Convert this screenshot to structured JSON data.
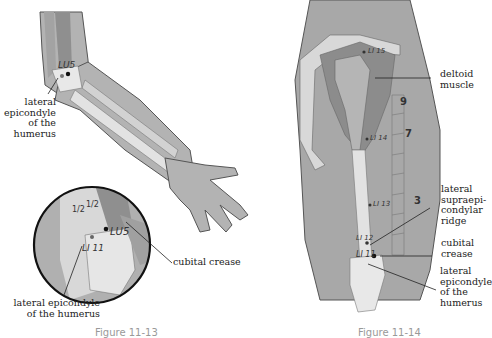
{
  "figure_left": {
    "caption": "Figure 11-13",
    "points": {
      "lu5_top": "LU5",
      "lu5_inset": "LU5",
      "li11_inset": "LI 11"
    },
    "fractions": [
      "1/2",
      "1/2"
    ],
    "labels": {
      "epicondyle_top": [
        "lateral",
        "epicondyle",
        "of the",
        "humerus"
      ],
      "cubital_crease": "cubital crease",
      "epicondyle_bottom": [
        "lateral epicondyle",
        "of the humerus"
      ]
    }
  },
  "figure_right": {
    "caption": "Figure 11-14",
    "points": {
      "li15": "LI 15",
      "li14": "LI 14",
      "li13": "LI 13",
      "li12": "LI 12",
      "li11": "LI 11"
    },
    "scale_numbers": [
      "9",
      "7",
      "3"
    ],
    "labels": {
      "deltoid": [
        "deltoid",
        "muscle"
      ],
      "supraepicondylar": [
        "lateral",
        "supraepi-",
        "condylar",
        "ridge"
      ],
      "cubital_crease": [
        "cubital",
        "crease"
      ],
      "epicondyle": [
        "lateral",
        "epicondyle",
        "of the",
        "humerus"
      ]
    }
  },
  "colors": {
    "skin": "#b3b3b3",
    "muscle": "#9a9a9a",
    "bone": "#e2e2e2",
    "outline": "#555555"
  }
}
